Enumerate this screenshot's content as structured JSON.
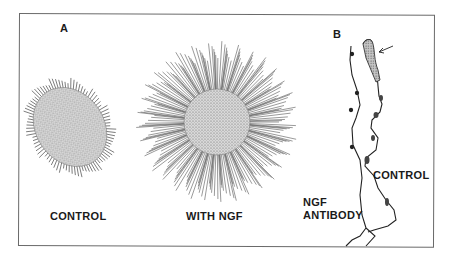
{
  "figure": {
    "panel_a": {
      "letter": "A",
      "control_label": "CONTROL",
      "ngf_label": "WITH NGF"
    },
    "panel_b": {
      "letter": "B",
      "control_label": "CONTROL",
      "antibody_label_line1": "NGF",
      "antibody_label_line2": "ANTIBODY"
    },
    "colors": {
      "ink": "#1a1a1a",
      "frame": "#6a6a6a",
      "stipple": "#8a8a8a",
      "background": "#ffffff"
    }
  }
}
